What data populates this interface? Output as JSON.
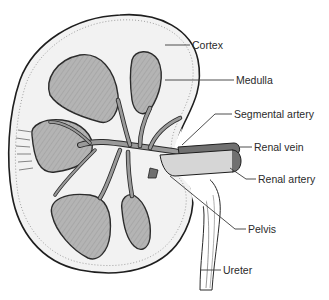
{
  "diagram": {
    "labels": [
      {
        "id": "cortex",
        "text": "Cortex"
      },
      {
        "id": "medulla",
        "text": "Medulla"
      },
      {
        "id": "segmental-artery",
        "text": "Segmental artery"
      },
      {
        "id": "renal-vein",
        "text": "Renal vein"
      },
      {
        "id": "renal-artery",
        "text": "Renal artery"
      },
      {
        "id": "pelvis",
        "text": "Pelvis"
      },
      {
        "id": "ureter",
        "text": "Ureter"
      }
    ],
    "colors": {
      "background": "#ffffff",
      "cortex_fill": "#f2f2f2",
      "medulla_fill": "#b4b4b4",
      "vessel_fill": "#9a9a9a",
      "vein_fill": "#707070",
      "outline": "#1e1e1e"
    }
  }
}
